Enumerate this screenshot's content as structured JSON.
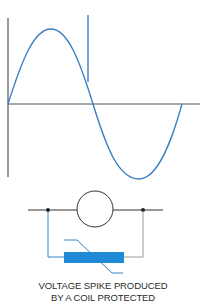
{
  "diagram": {
    "type": "electrical illustration",
    "waveform": {
      "description": "AC sine wave with a vertical voltage spike on the falling edge of the positive half-cycle",
      "axes": {
        "vertical": "voltage",
        "horizontal": "time"
      },
      "spike": "vertical line rising above the curve"
    },
    "circuit": {
      "components": [
        "coil (circle)",
        "varistor / suppression device (blue bar with diagonal line)"
      ],
      "connection": "suppression device wired in parallel with coil"
    },
    "caption": {
      "line1": "VOLTAGE SPIKE PRODUCED",
      "line2": "BY A COIL PROTECTED"
    },
    "colors": {
      "axis": "#555555",
      "curve": "#3a7fc4",
      "wire": "#333333",
      "blue_wire": "#2f86cc",
      "varistor_fill": "#1f8ad6",
      "gray_wire": "#9a9a9a"
    }
  }
}
